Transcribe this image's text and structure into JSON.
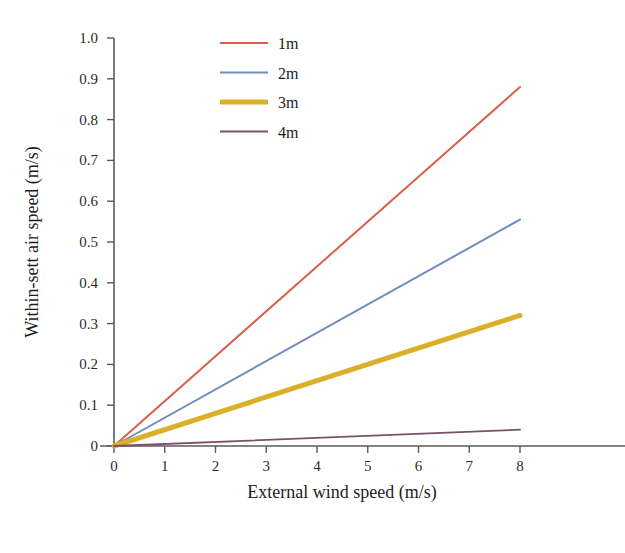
{
  "chart_data": {
    "type": "line",
    "title": "",
    "xlabel": "External wind speed (m/s)",
    "ylabel": "Within-sett air speed (m/s)",
    "xlim": [
      0,
      8
    ],
    "ylim": [
      0,
      1.0
    ],
    "xticks": [
      0,
      1,
      2,
      3,
      4,
      5,
      6,
      7,
      8
    ],
    "xtick_labels": [
      "0",
      "1",
      "2",
      "3",
      "4",
      "5",
      "6",
      "7",
      "8"
    ],
    "yticks": [
      0,
      0.1,
      0.2,
      0.3,
      0.4,
      0.5,
      0.6,
      0.7,
      0.8,
      0.9,
      1.0
    ],
    "ytick_labels": [
      "0",
      "0.1",
      "0.2",
      "0.3",
      "0.4",
      "0.5",
      "0.6",
      "0.7",
      "0.8",
      "0.9",
      "1.0"
    ],
    "grid": false,
    "legend_position": "top-right-inside",
    "x": [
      0,
      8
    ],
    "series": [
      {
        "name": "1m",
        "values": [
          0,
          0.88
        ],
        "color": "#d9604a",
        "width": 2.0
      },
      {
        "name": "2m",
        "values": [
          0,
          0.555
        ],
        "color": "#6f8cc0",
        "width": 2.0
      },
      {
        "name": "3m",
        "values": [
          0,
          0.32
        ],
        "color": "#dcaf2a",
        "width": 5.0
      },
      {
        "name": "4m",
        "values": [
          0,
          0.04
        ],
        "color": "#7a5068",
        "width": 1.8
      }
    ]
  },
  "legend": {
    "items": [
      {
        "label": "1m"
      },
      {
        "label": "2m"
      },
      {
        "label": "3m"
      },
      {
        "label": "4m"
      }
    ]
  },
  "axes": {
    "x_title": "External wind speed (m/s)",
    "y_title": "Within-sett air speed (m/s)"
  }
}
